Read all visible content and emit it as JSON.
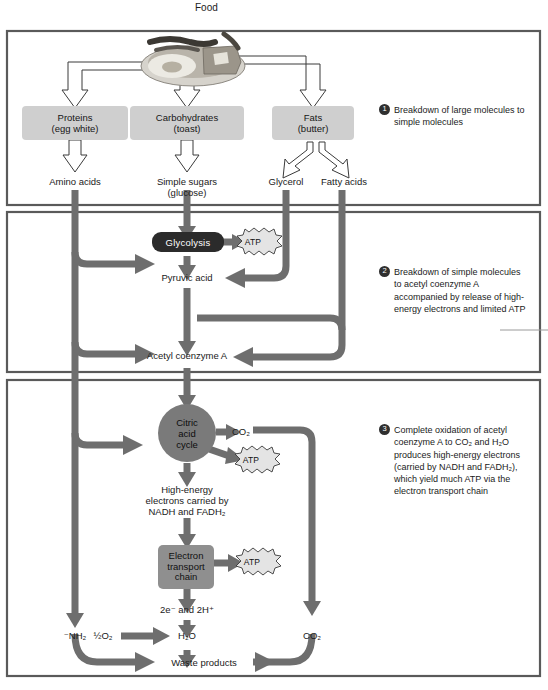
{
  "figure": {
    "title": "Food",
    "type": "cellular-respiration-flow-diagram"
  },
  "food_image": {
    "alt": "plate-of-food-egg-toast-bacon"
  },
  "stage1": {
    "substrates": [
      {
        "name": "proteins",
        "label": "Proteins\n(egg white)",
        "line1": "Proteins",
        "line2": "(egg white)",
        "product": "Amino acids"
      },
      {
        "name": "carbohydrates",
        "label": "Carbohydrates\n(toast)",
        "line1": "Carbohydrates",
        "line2": "(toast)",
        "product": "Simple sugars\n(glucose)",
        "product_line1": "Simple sugars",
        "product_line2": "(glucose)"
      },
      {
        "name": "fats",
        "label": "Fats\n(butter)",
        "line1": "Fats",
        "line2": "(butter)",
        "product_a": "Glycerol",
        "product_b": "Fatty acids"
      }
    ],
    "callout": {
      "number": "1",
      "text": "Breakdown of large molecules to simple molecules"
    }
  },
  "stage2": {
    "glycolysis": "Glycolysis",
    "atp": "ATP",
    "pyruvic_acid": "Pyruvic acid",
    "acetyl_coa": "Acetyl coenzyme A",
    "callout": {
      "number": "2",
      "text": "Breakdown of simple molecules to acetyl coenzyme A accompanied by release of high-energy electrons and limited ATP"
    }
  },
  "stage3": {
    "citric_acid_cycle": {
      "line1": "Citric",
      "line2": "acid",
      "line3": "cycle"
    },
    "co2_from_cycle": "CO₂",
    "atp_from_cycle": "ATP",
    "high_energy_electrons": {
      "line1": "High-energy",
      "line2": "electrons carried by",
      "line3": "NADH and FADH₂"
    },
    "electron_transport_chain": {
      "line1": "Electron",
      "line2": "transport",
      "line3": "chain"
    },
    "atp_from_etc": "ATP",
    "electrons_protons": "2e⁻ and 2H⁺",
    "amino_group": "⁻NH₂",
    "oxygen": "½O₂",
    "water": "H₂O",
    "co2_waste": "CO₂",
    "waste_products": "Waste products",
    "callout": {
      "number": "3",
      "text": "Complete oxidation of acetyl coenzyme A to CO₂ and H₂O produces high-energy electrons (carried by NADH and FADH₂), which yield much ATP via the electron transport chain"
    }
  },
  "colors": {
    "flow_arrow": "#6e6e6e",
    "outline_arrow": "#ffffff",
    "substrate_box": "#cfcfcf",
    "glycolysis_box": "#2b2b2b",
    "citric_circle": "#7a7a7a",
    "etc_box": "#8f8f8f",
    "frame": "#5a5a5a",
    "text": "#1a1a1a"
  }
}
